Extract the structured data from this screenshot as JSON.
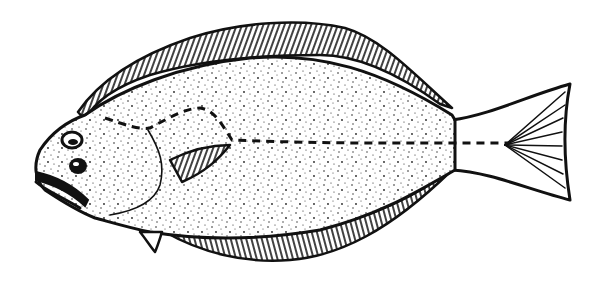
{
  "image": {
    "subject": "flatfish illustration",
    "style": "black ink stipple drawing",
    "colors": {
      "background": "#ffffff",
      "ink": "#111111"
    }
  }
}
